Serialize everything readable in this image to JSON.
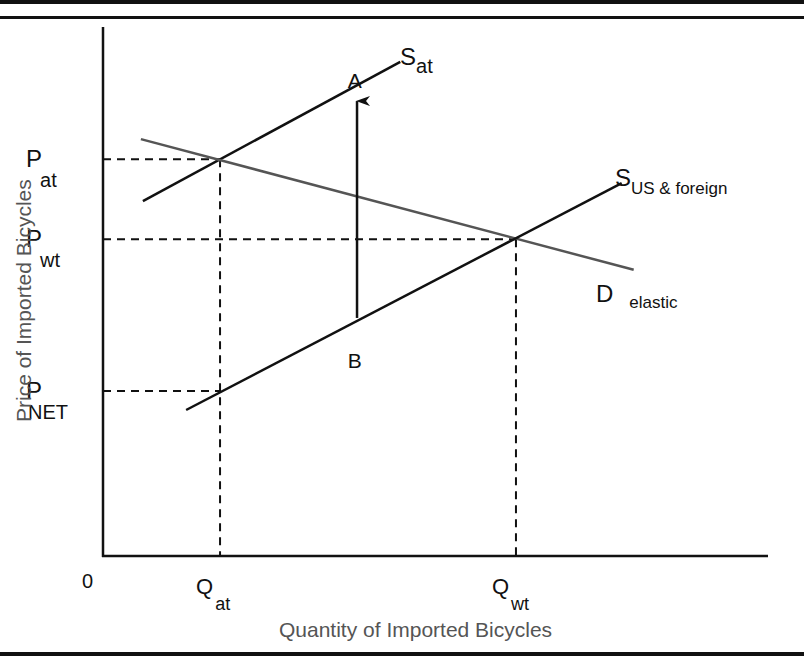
{
  "chart_data": {
    "type": "line",
    "title": "",
    "xlabel": "Quantity of Imported Bicycles",
    "ylabel": "Price of Imported Bicycles",
    "origin_label": "0",
    "xlim": [
      0,
      100
    ],
    "ylim": [
      0,
      100
    ],
    "grid": false,
    "price_levels": [
      {
        "id": "p_at",
        "main": "P",
        "sub": "at",
        "value": 75.0
      },
      {
        "id": "p_wt",
        "main": "P",
        "sub": "wt",
        "value": 59.9
      },
      {
        "id": "p_net",
        "main": "P",
        "sub": "NET",
        "value": 31.2
      }
    ],
    "quantity_levels": [
      {
        "id": "q_at",
        "main": "Q",
        "sub": "at",
        "value": 17.6
      },
      {
        "id": "q_wt",
        "main": "Q",
        "sub": "wt",
        "value": 62.1
      }
    ],
    "series": [
      {
        "name": "S at",
        "label_main": "S",
        "label_sub": "at",
        "color": "#111111",
        "points": [
          [
            6.0,
            67.1
          ],
          [
            44.7,
            93.4
          ]
        ]
      },
      {
        "name": "D elastic",
        "label_main": "D",
        "label_sub": "elastic",
        "color": "#555555",
        "points": [
          [
            5.7,
            78.8
          ],
          [
            79.8,
            54.1
          ]
        ]
      },
      {
        "name": "S US & foreign",
        "label_main": "S",
        "label_sub": "US & foreign",
        "color": "#111111",
        "points": [
          [
            12.5,
            27.6
          ],
          [
            78.0,
            70.5
          ]
        ]
      }
    ],
    "annotations": [
      {
        "text": "A",
        "kind": "point-label",
        "x": 38.0,
        "y": 90.0
      },
      {
        "text": "B",
        "kind": "point-label",
        "x": 38.0,
        "y": 37.0
      },
      {
        "kind": "arrow",
        "from": [
          38.2,
          45.0
        ],
        "to": [
          38.2,
          86.0
        ]
      }
    ]
  }
}
